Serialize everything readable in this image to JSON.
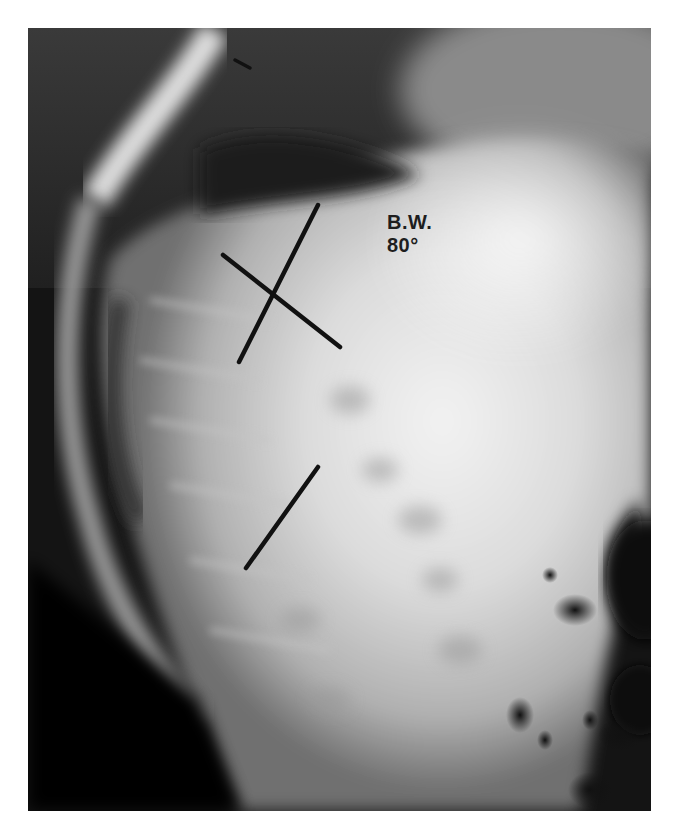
{
  "figure": {
    "type": "lateral spine radiograph",
    "annotation": {
      "label": "B.W.",
      "angle": "80°"
    },
    "measurement_lines": [
      {
        "name": "endplate-line-upper-long",
        "x1": 318,
        "y1": 205,
        "x2": 239,
        "y2": 362
      },
      {
        "name": "endplate-line-upper-cross",
        "x1": 223,
        "y1": 255,
        "x2": 340,
        "y2": 347
      },
      {
        "name": "endplate-line-lower",
        "x1": 318,
        "y1": 467,
        "x2": 246,
        "y2": 568
      },
      {
        "name": "tick-mark-top",
        "x1": 235,
        "y1": 60,
        "x2": 250,
        "y2": 68
      }
    ],
    "colors": {
      "line": "#111111",
      "text": "#1e1e1e",
      "background": "#ffffff"
    }
  },
  "caption": {
    "text": ""
  }
}
